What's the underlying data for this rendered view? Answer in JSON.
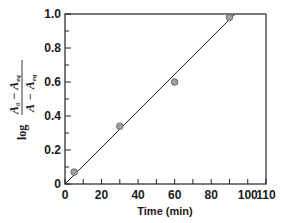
{
  "chart_data": {
    "type": "scatter",
    "title": "",
    "xlabel": "Time (min)",
    "ylabel": "log (A0 − Aeq)/(A − Aeq)",
    "ylabel_parts": {
      "log": "log",
      "num_a": "A",
      "num_a_sub": "0",
      "minus": "−",
      "num_b": "A",
      "num_b_sub": "eq",
      "den_a": "A",
      "den_b": "A",
      "den_b_sub": "eq"
    },
    "xlim": [
      0,
      110
    ],
    "ylim": [
      0,
      1.0
    ],
    "xticks": [
      "0",
      "20",
      "40",
      "60",
      "80",
      "100",
      "110"
    ],
    "yticks": [
      "0",
      "0.2",
      "0.4",
      "0.6",
      "0.8",
      "1.0"
    ],
    "grid": false,
    "series": [
      {
        "name": "data",
        "x": [
          5,
          30,
          60,
          90
        ],
        "y": [
          0.07,
          0.34,
          0.6,
          0.98
        ],
        "marker": "circle",
        "color": "#a0a0a0"
      }
    ],
    "fit_line": {
      "x": [
        0,
        93
      ],
      "y": [
        0,
        1.0
      ],
      "color": "#222222"
    }
  }
}
